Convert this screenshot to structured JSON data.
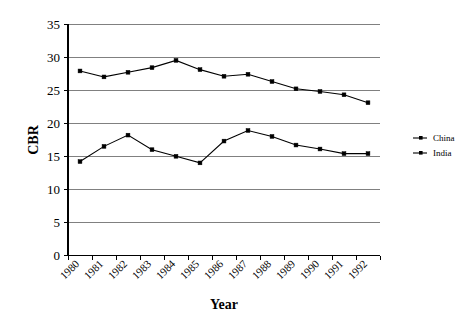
{
  "chart_data": {
    "type": "line",
    "title": "",
    "xlabel": "Year",
    "ylabel": "CBR",
    "categories": [
      "1980",
      "1981",
      "1982",
      "1983",
      "1984",
      "1985",
      "1986",
      "1987",
      "1988",
      "1989",
      "1990",
      "1991",
      "1992"
    ],
    "x": [
      1980,
      1981,
      1982,
      1983,
      1984,
      1985,
      1986,
      1987,
      1988,
      1989,
      1990,
      1991,
      1992
    ],
    "series": [
      {
        "name": "China",
        "marker": "square",
        "color": "#000000",
        "values": [
          14.2,
          16.5,
          18.2,
          16.0,
          15.0,
          14.0,
          17.3,
          18.9,
          18.0,
          16.7,
          16.1,
          15.4,
          15.4
        ]
      },
      {
        "name": "India",
        "marker": "square",
        "color": "#000000",
        "values": [
          27.9,
          27.0,
          27.7,
          28.4,
          29.5,
          28.1,
          27.1,
          27.4,
          26.3,
          25.2,
          24.8,
          24.3,
          23.1
        ]
      }
    ],
    "ylim": [
      0,
      35
    ],
    "ytick_step": 5,
    "yticks": [
      "0",
      "5",
      "10",
      "15",
      "20",
      "25",
      "30",
      "35"
    ],
    "grid": "horizontal",
    "grid_color": "#808080",
    "legend_position": "right",
    "plot_background": "#ffffff",
    "border": "left-and-bottom"
  },
  "legend": {
    "entries": [
      {
        "label": "China"
      },
      {
        "label": "India"
      }
    ]
  },
  "axes": {
    "y_title": "CBR",
    "x_title": "Year"
  }
}
